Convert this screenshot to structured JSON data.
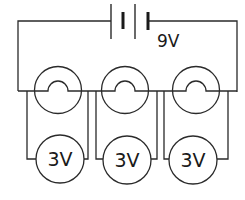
{
  "diagram": {
    "type": "circuit",
    "battery": {
      "label": "9V",
      "cells": 2
    },
    "lamps": [
      {
        "id": "lamp-1"
      },
      {
        "id": "lamp-2"
      },
      {
        "id": "lamp-3"
      }
    ],
    "meters": [
      {
        "id": "meter-1",
        "label": "3V"
      },
      {
        "id": "meter-2",
        "label": "3V"
      },
      {
        "id": "meter-3",
        "label": "3V"
      }
    ],
    "colors": {
      "line": "#2a2a2a",
      "background": "#ffffff"
    }
  }
}
